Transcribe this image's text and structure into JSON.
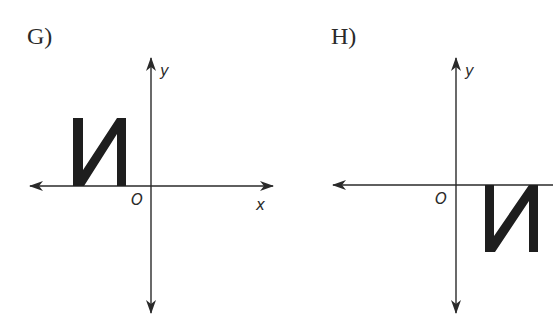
{
  "figure": {
    "panels": [
      {
        "id": "G",
        "label": "G)",
        "origin_label": "O",
        "x_axis_label": "x",
        "y_axis_label": "y",
        "figure_glyph": "И",
        "figure_position": "second quadrant, resting on x-axis (above x-axis, left of y-axis)"
      },
      {
        "id": "H",
        "label": "H)",
        "origin_label": "O",
        "x_axis_label": "",
        "y_axis_label": "y",
        "figure_glyph": "И",
        "figure_position": "fourth quadrant, hanging from x-axis (below x-axis, right of y-axis)"
      }
    ],
    "colors": {
      "ink": "#2a2a2a",
      "shape": "#1e1e1e",
      "background": "#ffffff"
    }
  }
}
